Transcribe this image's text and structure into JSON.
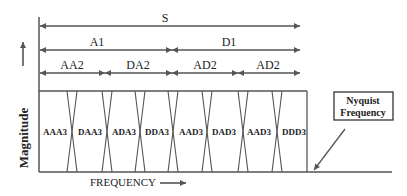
{
  "diagram": {
    "y_axis_label": "Magnitude",
    "x_axis_label": "FREQUENCY",
    "level0": {
      "label": "S"
    },
    "level1": [
      {
        "label": "A1"
      },
      {
        "label": "D1"
      }
    ],
    "level2": [
      {
        "label": "AA2"
      },
      {
        "label": "DA2"
      },
      {
        "label": "AD2"
      },
      {
        "label": "AD2"
      }
    ],
    "level3": [
      {
        "label": "AAA3"
      },
      {
        "label": "DAA3"
      },
      {
        "label": "ADA3"
      },
      {
        "label": "DDA3"
      },
      {
        "label": "AAD3"
      },
      {
        "label": "DAD3"
      },
      {
        "label": "AAD3"
      },
      {
        "label": "DDD3"
      }
    ],
    "callout": {
      "line1": "Nyquist",
      "line2": "Frequency"
    },
    "colors": {
      "line": "#555555",
      "text": "#222222",
      "background": "#ffffff"
    }
  }
}
